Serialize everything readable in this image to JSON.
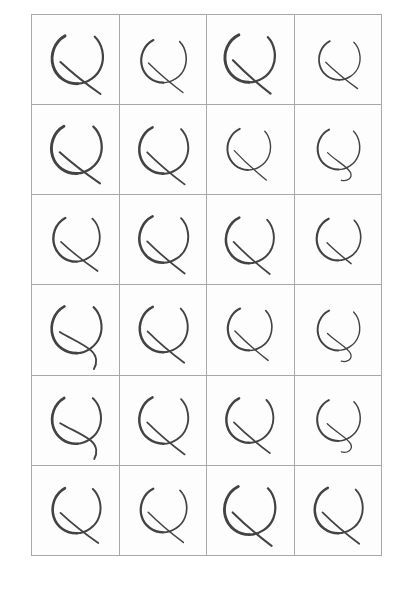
{
  "document": {
    "kind": "scanned-handwriting-sample-sheet",
    "title": "Handwritten Character Sample Grid",
    "description": "Scanned sheet of repeated handwritten glyph samples arranged in a ruled grid",
    "page_background": "#ffffff"
  },
  "grid": {
    "columns": 4,
    "rows": 6,
    "cell_count": 24,
    "left": 31,
    "top": 14,
    "width": 351,
    "height": 542,
    "cell_width": 87.75,
    "cell_height": 90.33,
    "line_color": "#a8a8a8",
    "line_width": 1,
    "cell_background": "#fdfdfd"
  },
  "ink": {
    "color": "#434343",
    "light_color": "#5a5a5a",
    "dark_color": "#333333",
    "style": "ballpoint-pen",
    "glyph_name": "handwritten-curl-glyph"
  },
  "cells": [
    {
      "row": 1,
      "col": 1,
      "id": "cell-1-1",
      "glyph": "curl-glyph",
      "variant": "long-straight-tail",
      "stroke_width": 3.1,
      "scale": 1.04,
      "rotate": -2,
      "tx": 2,
      "ty": 0
    },
    {
      "row": 1,
      "col": 2,
      "id": "cell-1-2",
      "glyph": "curl-glyph",
      "variant": "long-straight-tail",
      "stroke_width": 2.6,
      "scale": 0.92,
      "rotate": 0,
      "tx": 0,
      "ty": 2
    },
    {
      "row": 1,
      "col": 3,
      "id": "cell-1-3",
      "glyph": "curl-glyph",
      "variant": "long-straight-tail",
      "stroke_width": 3.2,
      "scale": 1.02,
      "rotate": 1,
      "tx": -1,
      "ty": -1
    },
    {
      "row": 1,
      "col": 4,
      "id": "cell-1-4",
      "glyph": "curl-glyph",
      "variant": "long-straight-tail",
      "stroke_width": 2.4,
      "scale": 0.84,
      "rotate": -1,
      "tx": 1,
      "ty": 1
    },
    {
      "row": 2,
      "col": 1,
      "id": "cell-2-1",
      "glyph": "curl-glyph",
      "variant": "long-straight-tail",
      "stroke_width": 3.2,
      "scale": 1.03,
      "rotate": -3,
      "tx": 1,
      "ty": 0
    },
    {
      "row": 2,
      "col": 2,
      "id": "cell-2-2",
      "glyph": "curl-glyph",
      "variant": "long-straight-tail",
      "stroke_width": 2.9,
      "scale": 1.0,
      "rotate": 0,
      "tx": 0,
      "ty": 1
    },
    {
      "row": 2,
      "col": 3,
      "id": "cell-2-3",
      "glyph": "curl-glyph",
      "variant": "long-straight-tail",
      "stroke_width": 2.5,
      "scale": 0.88,
      "rotate": 2,
      "tx": -2,
      "ty": 0
    },
    {
      "row": 2,
      "col": 4,
      "id": "cell-2-4",
      "glyph": "curl-glyph",
      "variant": "curled-tail",
      "stroke_width": 2.6,
      "scale": 0.86,
      "rotate": 0,
      "tx": 0,
      "ty": 0
    },
    {
      "row": 3,
      "col": 1,
      "id": "cell-3-1",
      "glyph": "curl-glyph",
      "variant": "long-straight-tail",
      "stroke_width": 2.8,
      "scale": 0.95,
      "rotate": -2,
      "tx": 1,
      "ty": 0
    },
    {
      "row": 3,
      "col": 2,
      "id": "cell-3-2",
      "glyph": "curl-glyph",
      "variant": "long-straight-tail",
      "stroke_width": 2.9,
      "scale": 1.0,
      "rotate": 0,
      "tx": 0,
      "ty": 0
    },
    {
      "row": 3,
      "col": 3,
      "id": "cell-3-3",
      "glyph": "curl-glyph",
      "variant": "long-straight-tail",
      "stroke_width": 2.9,
      "scale": 0.98,
      "rotate": 1,
      "tx": -1,
      "ty": 1
    },
    {
      "row": 3,
      "col": 4,
      "id": "cell-3-4",
      "glyph": "curl-glyph",
      "variant": "short-tail",
      "stroke_width": 2.7,
      "scale": 0.9,
      "rotate": 0,
      "tx": 0,
      "ty": 0
    },
    {
      "row": 4,
      "col": 1,
      "id": "cell-4-1",
      "glyph": "curl-glyph",
      "variant": "wavy-tail",
      "stroke_width": 3.0,
      "scale": 1.02,
      "rotate": -2,
      "tx": 1,
      "ty": 0
    },
    {
      "row": 4,
      "col": 2,
      "id": "cell-4-2",
      "glyph": "curl-glyph",
      "variant": "long-straight-tail",
      "stroke_width": 2.9,
      "scale": 0.98,
      "rotate": 0,
      "tx": 0,
      "ty": 0
    },
    {
      "row": 4,
      "col": 3,
      "id": "cell-4-3",
      "glyph": "curl-glyph",
      "variant": "long-straight-tail",
      "stroke_width": 2.7,
      "scale": 0.9,
      "rotate": 1,
      "tx": -1,
      "ty": 0
    },
    {
      "row": 4,
      "col": 4,
      "id": "cell-4-4",
      "glyph": "curl-glyph",
      "variant": "curled-tail",
      "stroke_width": 2.5,
      "scale": 0.86,
      "rotate": 0,
      "tx": 0,
      "ty": 1
    },
    {
      "row": 5,
      "col": 1,
      "id": "cell-5-1",
      "glyph": "curl-glyph",
      "variant": "wavy-tail",
      "stroke_width": 3.0,
      "scale": 1.0,
      "rotate": -3,
      "tx": 1,
      "ty": 0
    },
    {
      "row": 5,
      "col": 2,
      "id": "cell-5-2",
      "glyph": "curl-glyph",
      "variant": "long-straight-tail",
      "stroke_width": 2.8,
      "scale": 1.0,
      "rotate": 0,
      "tx": 0,
      "ty": 0
    },
    {
      "row": 5,
      "col": 3,
      "id": "cell-5-3",
      "glyph": "curl-glyph",
      "variant": "long-straight-tail",
      "stroke_width": 2.9,
      "scale": 0.96,
      "rotate": 0,
      "tx": -1,
      "ty": 0
    },
    {
      "row": 5,
      "col": 4,
      "id": "cell-5-4",
      "glyph": "curl-glyph",
      "variant": "curled-tail",
      "stroke_width": 2.6,
      "scale": 0.88,
      "rotate": 0,
      "tx": 0,
      "ty": 0
    },
    {
      "row": 6,
      "col": 1,
      "id": "cell-6-1",
      "glyph": "curl-glyph",
      "variant": "long-straight-tail",
      "stroke_width": 3.0,
      "scale": 0.98,
      "rotate": -2,
      "tx": 1,
      "ty": 0
    },
    {
      "row": 6,
      "col": 2,
      "id": "cell-6-2",
      "glyph": "curl-glyph",
      "variant": "long-straight-tail",
      "stroke_width": 2.7,
      "scale": 0.94,
      "rotate": 0,
      "tx": 0,
      "ty": 0
    },
    {
      "row": 6,
      "col": 3,
      "id": "cell-6-3",
      "glyph": "curl-glyph",
      "variant": "long-straight-tail",
      "stroke_width": 3.1,
      "scale": 1.04,
      "rotate": 0,
      "tx": -1,
      "ty": 0
    },
    {
      "row": 6,
      "col": 4,
      "id": "cell-6-4",
      "glyph": "curl-glyph",
      "variant": "long-straight-tail",
      "stroke_width": 2.9,
      "scale": 0.98,
      "rotate": 0,
      "tx": 0,
      "ty": 0
    }
  ],
  "glyph_paths": {
    "left_arc": "M 36 24 C 24 30 19 44 22 56 C 25 68 36 76 48 76",
    "right_arc": "M 68 26 C 76 34 78 48 74 58 C 70 69 58 76 48 76",
    "tail_long_straight": "M 30 52 C 40 62 56 76 72 88",
    "tail_curled": "M 34 54 C 44 64 60 72 64 80 C 67 87 60 92 52 90",
    "tail_short": "M 34 54 C 42 62 54 72 64 80",
    "tail_wavy": "M 30 52 C 42 60 56 66 64 74 C 70 80 70 88 66 94"
  }
}
